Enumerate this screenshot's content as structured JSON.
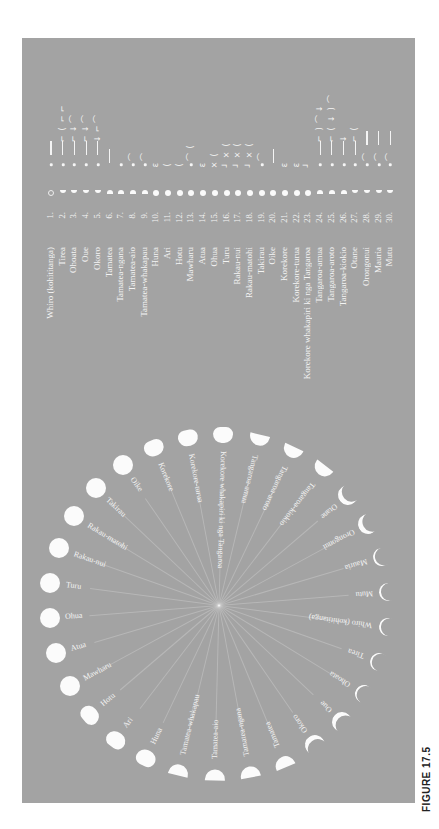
{
  "figure": {
    "caption": "FIGURE 17.5",
    "panel_color": "#a3a3a3",
    "foreground_color": "#f4f4f4"
  },
  "calendar": {
    "days": [
      {
        "n": "1.",
        "name": "Whiro (kohititanga)",
        "phase": "new",
        "marks": [
          "•",
          "|"
        ]
      },
      {
        "n": "2.",
        "name": "Tirea",
        "phase": "crescent",
        "marks": [
          "•",
          "|",
          "⌐",
          "(",
          "⌐",
          "⌐"
        ]
      },
      {
        "n": "3.",
        "name": "Ohoata",
        "phase": "crescent",
        "marks": [
          "•",
          "|",
          "⌐",
          "↓",
          "⌒"
        ]
      },
      {
        "n": "4.",
        "name": "Oue",
        "phase": "crescent",
        "marks": [
          "•",
          "|",
          "⌐",
          "↓",
          "⌒"
        ]
      },
      {
        "n": "5.",
        "name": "Okoro",
        "phase": "crescent",
        "marks": [
          "•",
          "|",
          "↓",
          "⌐",
          "⌒"
        ]
      },
      {
        "n": "6.",
        "name": "Tamatea",
        "phase": "half",
        "marks": [
          "|"
        ]
      },
      {
        "n": "7.",
        "name": "Tamatea-ngana",
        "phase": "half",
        "marks": [
          "•"
        ]
      },
      {
        "n": "8.",
        "name": "Tamatea-aio",
        "phase": "half",
        "marks": [
          "•",
          "⌒"
        ]
      },
      {
        "n": "9.",
        "name": "Tamatea-whakapau",
        "phase": "half",
        "marks": [
          "•",
          "⌒"
        ]
      },
      {
        "n": "10.",
        "name": "Huna",
        "phase": "gibbous",
        "marks": [
          "ɛ"
        ]
      },
      {
        "n": "11.",
        "name": "Ari",
        "phase": "gibbous",
        "marks": [
          "("
        ]
      },
      {
        "n": "12.",
        "name": "Hotu",
        "phase": "gibbous",
        "marks": [
          "("
        ]
      },
      {
        "n": "13.",
        "name": "Mawharu",
        "phase": "full",
        "marks": [
          "•",
          "⌒",
          "("
        ]
      },
      {
        "n": "14.",
        "name": "Atua",
        "phase": "full",
        "marks": [
          "ɛ"
        ]
      },
      {
        "n": "15.",
        "name": "Ohua",
        "phase": "full",
        "marks": [
          "×",
          "("
        ]
      },
      {
        "n": "16.",
        "name": "Turu",
        "phase": "full",
        "marks": [
          "┘",
          "×",
          "("
        ]
      },
      {
        "n": "17.",
        "name": "Rakau-nui",
        "phase": "full",
        "marks": [
          "┘",
          "×",
          "("
        ]
      },
      {
        "n": "18.",
        "name": "Rakau-matohi",
        "phase": "full",
        "marks": [
          "┘",
          "×",
          "("
        ]
      },
      {
        "n": "19.",
        "name": "Takirau",
        "phase": "full",
        "marks": [
          "•",
          "⌒"
        ]
      },
      {
        "n": "20.",
        "name": "Oike",
        "phase": "full",
        "marks": [
          "|"
        ]
      },
      {
        "n": "21.",
        "name": "Korekore",
        "phase": "gibbous",
        "marks": [
          "ɛ"
        ]
      },
      {
        "n": "22.",
        "name": "Korekore-turua",
        "phase": "gibbous",
        "marks": [
          "ɛ"
        ]
      },
      {
        "n": "23.",
        "name": "Korekore whakapiri ki nga Tangaroa",
        "phase": "gibbous",
        "marks": [
          "┘"
        ]
      },
      {
        "n": "24.",
        "name": "Tangaroa-amua",
        "phase": "half",
        "marks": [
          "•",
          "|",
          "⌐",
          ")",
          "⌒",
          "↓"
        ]
      },
      {
        "n": "25.",
        "name": "Tangaroa-aroto",
        "phase": "half",
        "marks": [
          "•",
          "|",
          "⌐",
          "(",
          "↓",
          ")",
          "⌒"
        ]
      },
      {
        "n": "26.",
        "name": "Tangaroa-kiokio",
        "phase": "half",
        "marks": [
          "•",
          "|",
          "↓"
        ]
      },
      {
        "n": "27.",
        "name": "Otane",
        "phase": "crescent",
        "marks": [
          "•",
          "|",
          "⌐",
          "("
        ]
      },
      {
        "n": "28.",
        "name": "Orongonui",
        "phase": "crescent",
        "marks": [
          "•",
          "⌒",
          "|"
        ]
      },
      {
        "n": "29.",
        "name": "Mauria",
        "phase": "crescent",
        "marks": [
          "•",
          "⌒",
          "|"
        ]
      },
      {
        "n": "30.",
        "name": "Mutu",
        "phase": "crescent",
        "marks": [
          "•",
          "⌒",
          "|"
        ]
      }
    ]
  },
  "circle": {
    "center": [
      219,
      605
    ],
    "radius": 170,
    "labels": [
      "Whiro (kohititanga)",
      "Tirea",
      "Ohoata",
      "Oue",
      "Okoro",
      "Tamatea",
      "Tamatea-ngana",
      "Tamatea-aio",
      "Tamatea-whakapau",
      "Huna",
      "Ari",
      "Hotu",
      "Mawharu",
      "Atua",
      "Ohua",
      "Turu",
      "Rakau-nui",
      "Rakau-matohi",
      "Takirau",
      "Oike",
      "Korekore",
      "Korekore-turua",
      "Korekore whakapiri ki nga Tangaroa",
      "Tangaroa-amua",
      "Tangaroa-aroto",
      "Tangaroa-kiokio",
      "Otane",
      "Orongonui",
      "Mauria",
      "Mutu"
    ]
  }
}
